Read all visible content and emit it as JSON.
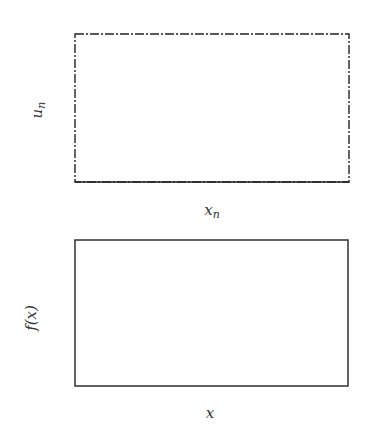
{
  "chart_data": [
    {
      "id": "top",
      "type": "scatter",
      "title": "",
      "xlabel": "x_n",
      "ylabel": "u_n",
      "xlim": [
        -2,
        6
      ],
      "ylim": [
        0,
        1
      ],
      "xticks": [
        -2,
        0,
        2,
        4,
        6
      ],
      "xtick_labels": [
        "−2",
        "0",
        "2",
        "4",
        "6"
      ],
      "yticks": [
        0,
        0.5,
        1
      ],
      "ytick_labels": [
        "0",
        "0.5",
        "1"
      ],
      "grid": false,
      "legend": null,
      "series": [
        {
          "name": "rejected samples",
          "color": "#c4c4c4",
          "description": "uniform proposals over x in [-2,6], u in [0,1] lying above f(x)/max",
          "count_approx": 2500
        },
        {
          "name": "accepted samples",
          "color": "#111111",
          "description": "points with u_n <= normalized Gaussian density (mean 2, sd ~0.61), forming a triangular/bell cloud peaking near x=2, u~0.85",
          "count_approx": 600
        }
      ]
    },
    {
      "id": "bottom",
      "type": "line",
      "title": "",
      "xlabel": "x",
      "ylabel": "f(x)",
      "xlim": [
        -2,
        6
      ],
      "ylim": [
        0,
        0.8
      ],
      "xticks": [
        -2,
        0,
        2,
        4,
        6
      ],
      "xtick_labels": [
        "−2",
        "0",
        "2",
        "4",
        "6"
      ],
      "yticks": [
        0,
        0.2,
        0.4,
        0.6,
        0.8
      ],
      "ytick_labels": [
        "0",
        "0.2",
        "0.4",
        "0.6",
        "0.8"
      ],
      "grid": false,
      "legend": null,
      "series": [
        {
          "name": "true density",
          "color": "#111111",
          "mean": 2.0,
          "sd": 0.614,
          "peak": 0.65
        },
        {
          "name": "empirical estimate",
          "color": "#6e6e6e",
          "x": [
            -2,
            0,
            0.4,
            0.6,
            0.8,
            1.0,
            1.1,
            1.2,
            1.4,
            1.6,
            1.8,
            1.9,
            2.0,
            2.1,
            2.2,
            2.3,
            2.4,
            2.5,
            2.6,
            2.8,
            3.0,
            3.2,
            3.4,
            3.6,
            3.8,
            4.0,
            4.2,
            6
          ],
          "y": [
            0,
            0,
            0.01,
            0.05,
            0.12,
            0.28,
            0.32,
            0.3,
            0.4,
            0.53,
            0.6,
            0.64,
            0.65,
            0.65,
            0.62,
            0.42,
            0.45,
            0.53,
            0.47,
            0.34,
            0.22,
            0.11,
            0.05,
            0.02,
            0.015,
            0.005,
            0.01,
            0
          ]
        }
      ]
    }
  ]
}
